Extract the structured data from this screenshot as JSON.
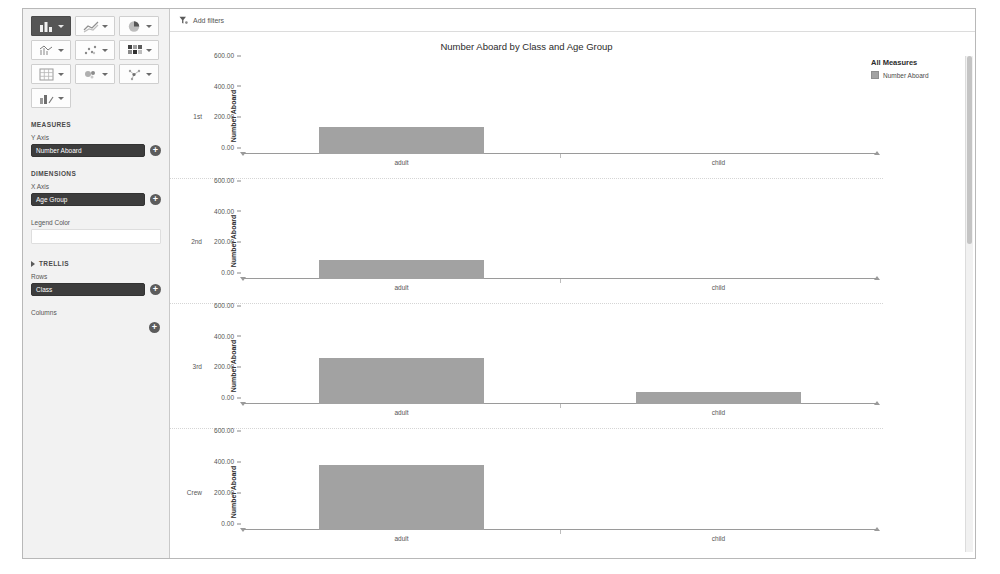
{
  "toolbar": {
    "buttons": [
      {
        "name": "bar-chart",
        "icon": "bar-chart-icon",
        "selected": true
      },
      {
        "name": "line-chart",
        "icon": "line-chart-icon",
        "selected": false
      },
      {
        "name": "pie-chart",
        "icon": "pie-chart-icon",
        "selected": false
      },
      {
        "name": "combination-chart",
        "icon": "combination-chart-icon",
        "selected": false
      },
      {
        "name": "scatter-plot",
        "icon": "scatter-plot-icon",
        "selected": false
      },
      {
        "name": "heat-map",
        "icon": "heat-map-icon",
        "selected": false
      },
      {
        "name": "cross-table",
        "icon": "cross-table-icon",
        "selected": false
      },
      {
        "name": "treemap",
        "icon": "treemap-icon",
        "selected": false
      },
      {
        "name": "network-chart",
        "icon": "network-chart-icon",
        "selected": false
      },
      {
        "name": "kpi-chart",
        "icon": "kpi-chart-icon",
        "selected": false
      }
    ]
  },
  "panel": {
    "measures_head": "MEASURES",
    "y_axis_label": "Y Axis",
    "y_axis_value": "Number Aboard",
    "dimensions_head": "DIMENSIONS",
    "x_axis_label": "X Axis",
    "x_axis_value": "Age Group",
    "legend_color_label": "Legend Color",
    "legend_color_value": "",
    "trellis_head": "TRELLIS",
    "rows_label": "Rows",
    "rows_value": "Class",
    "columns_label": "Columns",
    "columns_value": "",
    "add_symbol": "+"
  },
  "filter_bar": {
    "label": "Add filters"
  },
  "legend": {
    "title": "All Measures",
    "items": [
      {
        "label": "Number Aboard",
        "color": "#a2a2a2"
      }
    ]
  },
  "chart_data": {
    "type": "bar",
    "title": "Number Aboard by Class and Age Group",
    "xlabel": "",
    "ylabel": "Number Aboard",
    "categories": [
      "adult",
      "child"
    ],
    "ylim": [
      0,
      600
    ],
    "yticks": [
      0,
      200,
      400,
      600
    ],
    "ytick_labels": [
      "0.00",
      "200.00",
      "400.00",
      "600.00"
    ],
    "grid": false,
    "legend_position": "right",
    "trellis_rows_field": "Class",
    "trellis_columns_field": "",
    "series": [
      {
        "name": "Number Aboard",
        "color": "#a2a2a2"
      }
    ],
    "panels": [
      {
        "row": "1st",
        "values": [
          175,
          0
        ]
      },
      {
        "row": "2nd",
        "values": [
          125,
          0
        ]
      },
      {
        "row": "3rd",
        "values": [
          300,
          79
        ]
      },
      {
        "row": "Crew",
        "values": [
          420,
          0
        ]
      }
    ]
  },
  "colors": {
    "bar": "#a2a2a2",
    "pill": "#3d3d3d",
    "panel_bg": "#f2f2f2"
  }
}
